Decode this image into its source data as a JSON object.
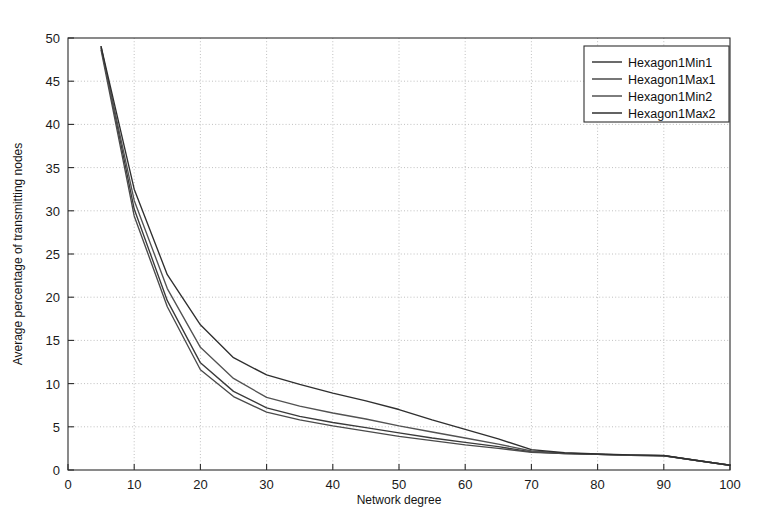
{
  "figure": {
    "background_color": "#ffffff",
    "axes_color": "#2b2b2b",
    "grid_color": "#b9b9b9"
  },
  "chart_data": {
    "type": "line",
    "title": "",
    "xlabel": "Network degree",
    "ylabel": "Average percentage of transmitting nodes",
    "xlim": [
      0,
      100
    ],
    "ylim": [
      0,
      50
    ],
    "xticks": [
      0,
      10,
      20,
      30,
      40,
      50,
      60,
      70,
      80,
      90,
      100
    ],
    "yticks": [
      0,
      5,
      10,
      15,
      20,
      25,
      30,
      35,
      40,
      45,
      50
    ],
    "grid": true,
    "legend_position": "upper right",
    "x": [
      5,
      10,
      15,
      20,
      25,
      30,
      35,
      40,
      45,
      50,
      55,
      60,
      65,
      70,
      75,
      80,
      85,
      90,
      95,
      100
    ],
    "series": [
      {
        "name": "Hexagon1Min1",
        "color": "#3a3a3a",
        "values": [
          49.0,
          30.2,
          19.6,
          12.4,
          9.1,
          7.2,
          6.2,
          5.5,
          4.9,
          4.3,
          3.7,
          3.2,
          2.7,
          2.1,
          1.9,
          1.8,
          1.7,
          1.65,
          1.1,
          0.55
        ]
      },
      {
        "name": "Hexagon1Max1",
        "color": "#4a4a4a",
        "values": [
          48.6,
          29.4,
          18.9,
          11.6,
          8.5,
          6.7,
          5.8,
          5.1,
          4.5,
          3.9,
          3.4,
          2.9,
          2.5,
          2.05,
          1.9,
          1.8,
          1.7,
          1.65,
          1.1,
          0.55
        ]
      },
      {
        "name": "Hexagon1Min2",
        "color": "#525252",
        "values": [
          48.8,
          31.2,
          21.0,
          14.2,
          10.6,
          8.4,
          7.4,
          6.6,
          5.9,
          5.1,
          4.4,
          3.7,
          3.0,
          2.2,
          1.95,
          1.82,
          1.72,
          1.66,
          1.1,
          0.55
        ]
      },
      {
        "name": "Hexagon1Max2",
        "color": "#2f2f2f",
        "values": [
          49.0,
          32.5,
          22.6,
          16.8,
          13.0,
          11.0,
          9.9,
          8.9,
          8.0,
          7.0,
          5.8,
          4.7,
          3.6,
          2.35,
          2.0,
          1.85,
          1.75,
          1.68,
          1.1,
          0.55
        ]
      }
    ]
  },
  "legend": {
    "entries": [
      {
        "label": "Hexagon1Min1"
      },
      {
        "label": "Hexagon1Max1"
      },
      {
        "label": "Hexagon1Min2"
      },
      {
        "label": "Hexagon1Max2"
      }
    ]
  }
}
